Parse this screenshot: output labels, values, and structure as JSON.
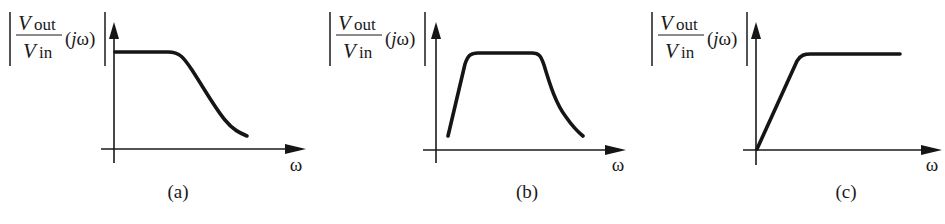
{
  "figure": {
    "panels": [
      {
        "id": "a",
        "caption": "(a)",
        "filter_type": "low-pass",
        "ylabel": {
          "numerator_base": "V",
          "numerator_sub": "out",
          "denominator_base": "V",
          "denominator_sub": "in",
          "argument": "(jω)"
        },
        "xlabel": "ω",
        "label_x": 10,
        "origin": {
          "x": 114,
          "y": 149
        },
        "yaxis": {
          "top": 22,
          "bottom": 163
        },
        "xaxis": {
          "left": 101,
          "right": 306
        },
        "omega_pos": {
          "x": 296,
          "y": 171
        },
        "caption_pos": {
          "x": 178,
          "y": 198
        },
        "curve_path": "M115,52 L168,52 C180,52 184,58 192,70 C205,90 215,108 225,120 C233,130 240,133 247,136"
      },
      {
        "id": "b",
        "caption": "(b)",
        "filter_type": "band-pass",
        "ylabel": {
          "numerator_base": "V",
          "numerator_sub": "out",
          "denominator_base": "V",
          "denominator_sub": "in",
          "argument": "(jω)"
        },
        "xlabel": "ω",
        "label_x": 330,
        "origin": {
          "x": 436,
          "y": 150
        },
        "yaxis": {
          "top": 22,
          "bottom": 163
        },
        "xaxis": {
          "left": 423,
          "right": 626
        },
        "omega_pos": {
          "x": 618,
          "y": 171
        },
        "caption_pos": {
          "x": 527,
          "y": 198
        },
        "curve_path": "M448,136 L465,64 C468,55 471,53 478,53 L532,53 C539,53 541,56 544,65 C550,85 556,104 566,117 C573,127 578,132 583,136"
      },
      {
        "id": "c",
        "caption": "(c)",
        "filter_type": "high-pass",
        "ylabel": {
          "numerator_base": "V",
          "numerator_sub": "out",
          "denominator_base": "V",
          "denominator_sub": "in",
          "argument": "(jω)"
        },
        "xlabel": "ω",
        "label_x": 652,
        "origin": {
          "x": 756,
          "y": 150
        },
        "yaxis": {
          "top": 22,
          "bottom": 165
        },
        "xaxis": {
          "left": 743,
          "right": 942
        },
        "omega_pos": {
          "x": 932,
          "y": 171
        },
        "caption_pos": {
          "x": 846,
          "y": 198
        },
        "curve_path": "M757,149 L797,61 C801,55 804,54 811,54 L900,54"
      }
    ]
  }
}
